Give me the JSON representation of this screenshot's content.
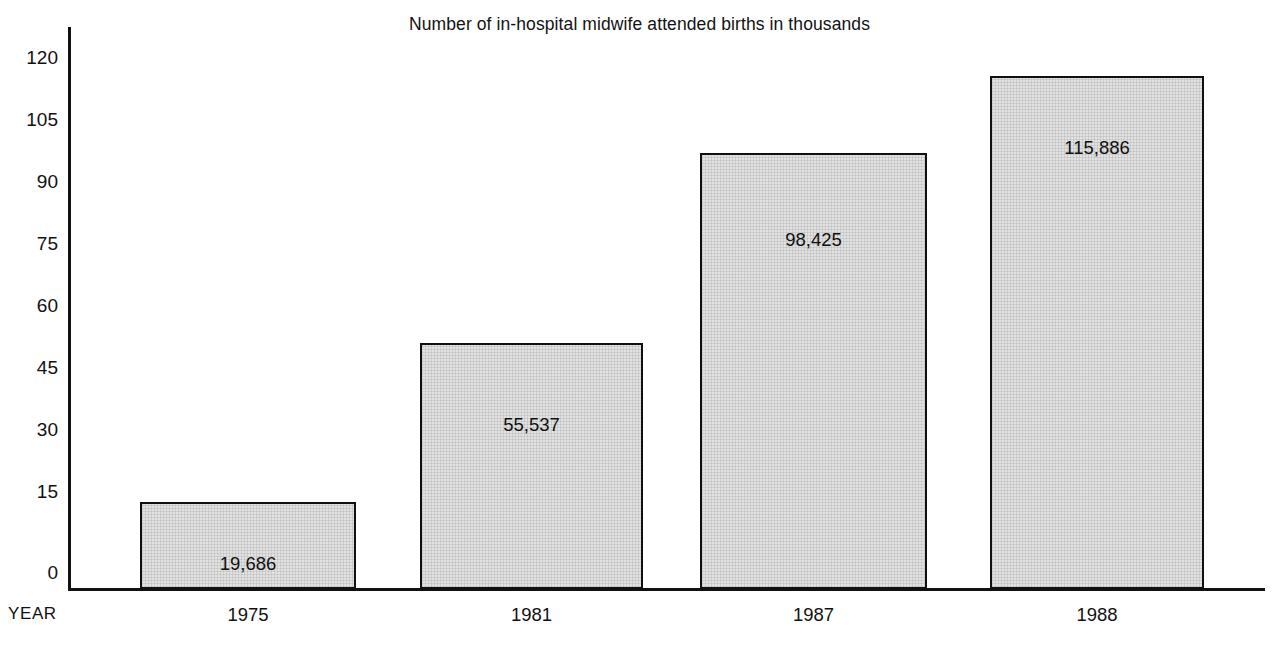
{
  "chart_data": {
    "type": "bar",
    "title": "Number of in-hospital midwife attended births in thousands",
    "xlabel": "YEAR",
    "ylabel": "",
    "categories": [
      "1975",
      "1981",
      "1987",
      "1988"
    ],
    "values": [
      19.686,
      55.537,
      98.425,
      115.886
    ],
    "data_labels": [
      "19,686",
      "55,537",
      "98,425",
      "115,886"
    ],
    "ylim": [
      0,
      127
    ],
    "yticks": [
      0,
      15,
      30,
      45,
      60,
      75,
      90,
      105,
      120
    ],
    "ytick_labels": [
      "0",
      "15",
      "30",
      "45",
      "60",
      "75",
      "90",
      "105",
      "120"
    ],
    "grid": false,
    "legend": "none",
    "bar_fill_color": "#e2e2e2",
    "bar_border_color": "#101010",
    "axis_color": "#111111",
    "background_color": "#ffffff"
  },
  "axis": {
    "year_caption": "YEAR"
  }
}
